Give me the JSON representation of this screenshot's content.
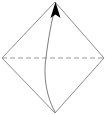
{
  "figure": {
    "width": 106,
    "height": 115,
    "background_color": "#ffffff"
  },
  "style": {
    "outline_color": "#808080",
    "outline_width": 0.9,
    "dashed_color": "#9a9a9a",
    "dashed_width": 1.0,
    "dash_pattern": "5,3",
    "arc_color": "#6f6f6f",
    "arc_width": 0.9,
    "arrow_fill": "#000000"
  },
  "geometry": {
    "vertices": {
      "top": {
        "label": "top-vertex",
        "x": 55,
        "y": 2
      },
      "left": {
        "label": "left-vertex",
        "x": 2,
        "y": 58
      },
      "right": {
        "label": "right-vertex",
        "x": 104,
        "y": 58
      },
      "bottom": {
        "label": "bottom-vertex",
        "x": 55,
        "y": 113
      }
    },
    "diamond_path": "M 55 2 L 104 58 L 55 113 L 2 58 Z",
    "dashed_diagonal": {
      "x1": 2,
      "y1": 58,
      "x2": 104,
      "y2": 58
    },
    "arc_path": "M 55 112 C 44 92 44 70 46 58 C 48 40 52 18 55.5 7",
    "arrowhead_path": "M 55.5 2 L 60.5 18 L 55.5 14.5 L 50.5 18 Z"
  },
  "labels": {
    "items": []
  }
}
